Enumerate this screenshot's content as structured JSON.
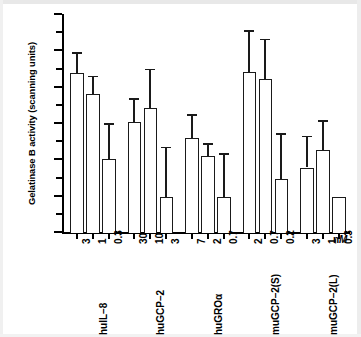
{
  "chart_data": {
    "type": "bar",
    "title": "",
    "xlabel": "nM",
    "ylabel": "Gelatinase B activity (scanning units)",
    "ylim": [
      0,
      1200
    ],
    "ytick_values": [
      0,
      200,
      400,
      600,
      800,
      1000,
      1200
    ],
    "ytick_labels": [
      "0",
      "200",
      "400",
      "600",
      "800",
      "1000",
      "1200"
    ],
    "yminor_step": 100,
    "grid": false,
    "legend": null,
    "unit_label": "nM",
    "groups": [
      {
        "name": "huIL–8",
        "bars": [
          {
            "dose": "3",
            "value": 875,
            "err_high": 990,
            "err_low": 760
          },
          {
            "dose": "1",
            "value": 760,
            "err_high": 860,
            "err_low": 660
          },
          {
            "dose": "0.3",
            "value": 400,
            "err_high": 600,
            "err_low": 200
          }
        ]
      },
      {
        "name": "huGCP–2",
        "bars": [
          {
            "dose": "30",
            "value": 605,
            "err_high": 735,
            "err_low": 475
          },
          {
            "dose": "10",
            "value": 680,
            "err_high": 900,
            "err_low": 460
          },
          {
            "dose": "3",
            "value": 190,
            "err_high": 470,
            "err_low": 0
          }
        ]
      },
      {
        "name": "huGROα",
        "bars": [
          {
            "dose": "7",
            "value": 515,
            "err_high": 650,
            "err_low": 380
          },
          {
            "dose": "2",
            "value": 420,
            "err_high": 490,
            "err_low": 350
          },
          {
            "dose": "0.7",
            "value": 190,
            "err_high": 435,
            "err_low": 0
          }
        ]
      },
      {
        "name": "muGCP–2(S)",
        "bars": [
          {
            "dose": "2",
            "value": 880,
            "err_high": 1110,
            "err_low": 650
          },
          {
            "dose": "0.7",
            "value": 840,
            "err_high": 1065,
            "err_low": 615
          },
          {
            "dose": "0.2",
            "value": 290,
            "err_high": 545,
            "err_low": 35
          }
        ]
      },
      {
        "name": "muGCP–2(L)",
        "bars": [
          {
            "dose": "3",
            "value": 355,
            "err_high": 530,
            "err_low": 180
          },
          {
            "dose": "1",
            "value": 450,
            "err_high": 615,
            "err_low": 285
          },
          {
            "dose": "0.3",
            "value": 190,
            "err_high": 190,
            "err_low": 190
          }
        ]
      }
    ]
  }
}
